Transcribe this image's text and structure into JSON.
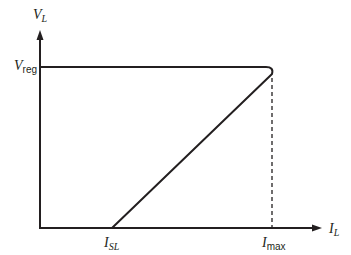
{
  "diagram": {
    "type": "foldback-current-limiting characteristic",
    "y_axis": {
      "symbol": "V",
      "subscript": "L"
    },
    "x_axis": {
      "symbol": "I",
      "subscript": "L"
    },
    "y_marks": [
      {
        "symbol": "V",
        "subscript": "reg"
      }
    ],
    "x_marks": [
      {
        "symbol": "I",
        "subscript": "SL"
      },
      {
        "symbol": "I",
        "subscript": "max"
      }
    ],
    "colors": {
      "line": "#231f20",
      "background": "#ffffff"
    }
  }
}
